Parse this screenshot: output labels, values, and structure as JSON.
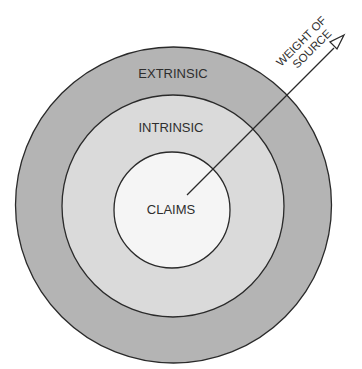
{
  "diagram": {
    "rings": {
      "outer": {
        "label": "EXTRINSIC",
        "fill": "#b4b4b4"
      },
      "middle": {
        "label": "INTRINSIC",
        "fill": "#dadada"
      },
      "inner": {
        "label": "CLAIMS",
        "fill": "#f5f5f5"
      }
    },
    "arrow": {
      "label_line1": "WEIGHT OF",
      "label_line2": "SOURCE"
    },
    "stroke_color": "#2a2a2a"
  }
}
